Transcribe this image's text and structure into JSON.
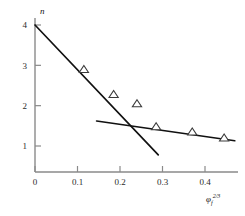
{
  "chart_data": {
    "type": "scatter",
    "title": "",
    "subtitle": "",
    "xlabel": "φf2/3",
    "xlabel_base": "φ",
    "xlabel_sub": "f",
    "xlabel_sup": "2/3",
    "ylabel": "n",
    "xlim": [
      0,
      0.48
    ],
    "ylim": [
      0.6,
      4.3
    ],
    "grid": false,
    "legend": "none",
    "xticks": [
      0,
      0.1,
      0.2,
      0.3,
      0.4
    ],
    "xticklabels": [
      "0",
      "0.1",
      "0.2",
      "0.3",
      "0.4"
    ],
    "yticks": [
      1,
      2,
      3,
      4
    ],
    "yticklabels": [
      "1",
      "2",
      "3",
      "4"
    ],
    "marker": "open-triangle",
    "points": [
      {
        "x": 0.115,
        "y": 2.9
      },
      {
        "x": 0.185,
        "y": 2.28
      },
      {
        "x": 0.24,
        "y": 2.05
      },
      {
        "x": 0.285,
        "y": 1.48
      },
      {
        "x": 0.37,
        "y": 1.35
      },
      {
        "x": 0.445,
        "y": 1.2
      }
    ],
    "series": [
      {
        "name": "steep-fit-line",
        "type": "line",
        "x": [
          0.0,
          0.29
        ],
        "y": [
          4.0,
          0.78
        ]
      },
      {
        "name": "shallow-fit-line",
        "type": "line",
        "x": [
          0.145,
          0.47
        ],
        "y": [
          1.62,
          1.13
        ]
      }
    ],
    "colors": {
      "line": "#111111",
      "axis": "#8a8a8a",
      "marker_stroke": "#3a3a3a",
      "marker_fill": "#ffffff",
      "background": "#ffffff",
      "text": "#2b2b2b"
    }
  }
}
